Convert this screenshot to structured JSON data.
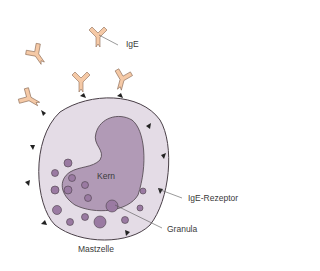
{
  "diagram": {
    "title": "Mastzelle",
    "labels": {
      "ige": "IgE",
      "kern": "Kern",
      "ige_rezeptor": "IgE-Rezeptor",
      "granula": "Granula",
      "mastzelle": "Mastzelle"
    },
    "colors": {
      "antibody_fill": "#f5c9a6",
      "antibody_stroke": "#8a6a55",
      "cell_fill": "#e4dce6",
      "cell_stroke": "#4a4048",
      "nucleus_fill": "#b19ab6",
      "granule_fill": "#9a7aa2",
      "receptor_fill": "#222222",
      "leader_line": "#555555"
    }
  }
}
